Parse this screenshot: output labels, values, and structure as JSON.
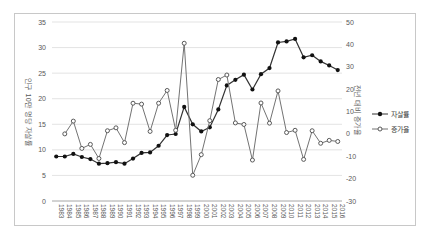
{
  "chart": {
    "left_axis": {
      "title": "인구 10만 명당 자살률",
      "ticks": [
        0,
        5,
        10,
        15,
        20,
        25,
        30,
        35
      ]
    },
    "right_axis": {
      "title": "전년 대비 증가율",
      "ticks": [
        -30,
        -20,
        -10,
        0,
        10,
        20,
        30,
        40,
        50
      ]
    },
    "legend": [
      {
        "label": "자살률",
        "marker": "filled-circle"
      },
      {
        "label": "증가율",
        "marker": "open-circle"
      }
    ],
    "colors": {
      "suicide_rate_line": "#333333",
      "growth_rate_line": "#737373",
      "gridline": "#dcdcdc",
      "axis_line": "#a6a6a6",
      "tick_text": "#595959",
      "frame_border": "#c8c8c8",
      "background": "#ffffff"
    }
  },
  "chart_data": {
    "type": "line",
    "x": [
      1983,
      1984,
      1985,
      1986,
      1987,
      1988,
      1989,
      1990,
      1991,
      1992,
      1993,
      1994,
      1995,
      1996,
      1997,
      1998,
      1999,
      2000,
      2001,
      2002,
      2003,
      2004,
      2005,
      2006,
      2007,
      2008,
      2009,
      2010,
      2011,
      2012,
      2013,
      2014,
      2015,
      2016
    ],
    "series": [
      {
        "name": "자살률",
        "axis": "left",
        "marker": "filled-circle",
        "values": [
          8.7,
          8.7,
          9.2,
          8.6,
          8.2,
          7.3,
          7.4,
          7.6,
          7.3,
          8.3,
          9.4,
          9.5,
          10.8,
          12.9,
          13.1,
          18.4,
          15.0,
          13.6,
          14.4,
          17.9,
          22.6,
          23.7,
          24.7,
          21.8,
          24.8,
          26.0,
          31.0,
          31.2,
          31.7,
          28.1,
          28.5,
          27.3,
          26.5,
          25.6
        ]
      },
      {
        "name": "증가율",
        "axis": "right",
        "marker": "open-circle",
        "values": [
          null,
          0.0,
          5.7,
          -6.5,
          -4.7,
          -11.0,
          1.4,
          2.7,
          -3.9,
          13.7,
          13.3,
          1.1,
          13.7,
          19.4,
          1.6,
          40.5,
          -18.5,
          -9.3,
          5.9,
          24.3,
          26.3,
          4.9,
          4.2,
          -11.7,
          13.8,
          4.8,
          19.2,
          0.6,
          1.6,
          -11.4,
          1.4,
          -4.2,
          -2.9,
          -3.4
        ]
      }
    ],
    "left_ylim": [
      0,
      35
    ],
    "right_ylim": [
      -30,
      50
    ],
    "grid": true,
    "legend_position": "right",
    "title": "",
    "xlabel": ""
  }
}
